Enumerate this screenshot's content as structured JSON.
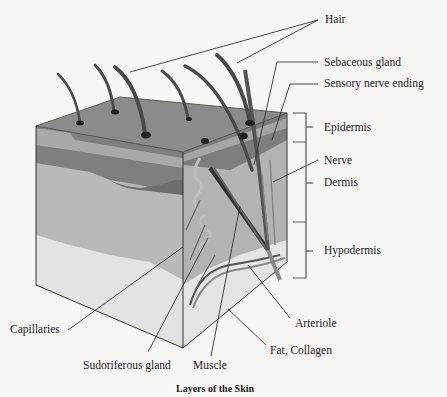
{
  "diagram": {
    "title": "Layers of the Skin",
    "labels": {
      "hair": "Hair",
      "sebaceous_gland": "Sebaceous gland",
      "sensory_nerve_ending": "Sensory nerve ending",
      "epidermis": "Epidermis",
      "nerve": "Nerve",
      "dermis": "Dermis",
      "hypodermis": "Hypodermis",
      "capillaries": "Capillaries",
      "arteriole": "Arteriole",
      "fat_collagen": "Fat, Collagen",
      "sudoriferous_gland": "Sudoriferous gland",
      "muscle": "Muscle"
    },
    "layers": [
      "Epidermis",
      "Dermis",
      "Hypodermis"
    ],
    "colors": {
      "background": "#f7f7f5",
      "top_surface": "#8a8a8a",
      "epidermis_band": "#a9a9a9",
      "dermis_dark": "#7d7d7d",
      "dermis_front": "#b8b8b8",
      "hypodermis_fat": "#e2e2e2",
      "hair": "#4a4a4a",
      "line": "#333333"
    }
  }
}
